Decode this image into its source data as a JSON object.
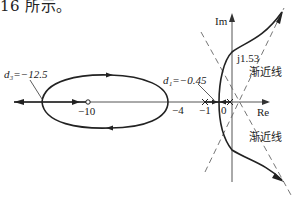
{
  "header": {
    "text": "16 所示。"
  },
  "diagram": {
    "type": "root-locus",
    "axes": {
      "real_label": "Re",
      "imag_label": "Im"
    },
    "real_axis_ticks": [
      {
        "label": "−10",
        "value": -10
      },
      {
        "label": "−4",
        "value": -4
      },
      {
        "label": "−1",
        "value": -1
      },
      {
        "label": "0",
        "value": 0
      }
    ],
    "annotations": {
      "d3": "d₃=−12.5",
      "d1": "d₁=−0.45",
      "imag_crossing": "j1.53",
      "asymptote_upper": "渐近线",
      "asymptote_lower": "渐近线"
    },
    "poles": [
      -1,
      0
    ],
    "zeros": [
      -10
    ],
    "breakaway_points": [
      -12.5,
      -0.45
    ],
    "imag_axis_crossing": 1.53,
    "colors": {
      "line": "#222222",
      "axis": "#555555",
      "dash": "#666666"
    }
  }
}
